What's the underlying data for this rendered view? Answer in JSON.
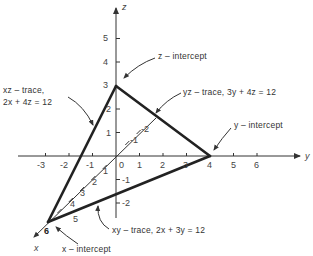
{
  "figure": {
    "plane_equation": "6x + 12y + 9z = ... (traces shown)",
    "axes": {
      "x": {
        "name": "x",
        "ticks_positive": [
          "1",
          "2",
          "3",
          "4",
          "5",
          "6"
        ],
        "ticks_negative": [
          "-1",
          "-2"
        ]
      },
      "y": {
        "name": "y",
        "ticks_negative": [
          "-3",
          "-2",
          "-1"
        ],
        "origin": "0",
        "ticks_positive": [
          "1",
          "2",
          "3",
          "4",
          "5",
          "6"
        ]
      },
      "z": {
        "name": "z",
        "ticks_positive": [
          "1",
          "2",
          "3",
          "4",
          "5"
        ],
        "ticks_negative": [
          "-1",
          "-2"
        ]
      }
    },
    "intercepts": {
      "x": {
        "label": "x – intercept",
        "value": 6
      },
      "y": {
        "label": "y – intercept",
        "value": 4
      },
      "z": {
        "label": "z – intercept",
        "value": 3
      }
    },
    "traces": {
      "xz": {
        "line1": "xz – trace,",
        "line2": "2x + 4z = 12"
      },
      "yz": {
        "label": "yz – trace, 3y + 4z = 12"
      },
      "xy": {
        "label": "xy – trace, 2x + 3y = 12"
      }
    },
    "colors": {
      "axis": "#333333",
      "trace": "#222222",
      "text": "#333333"
    }
  }
}
